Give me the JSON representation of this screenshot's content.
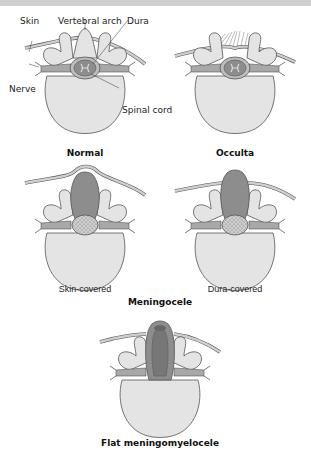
{
  "colors": {
    "bone": "#e4e4e4",
    "bone_stroke": "#555555",
    "skin": "#cccccc",
    "dura": "#8d8d8d",
    "cord": "#d9d9d9",
    "background": "#ffffff"
  },
  "labels": {
    "skin": "Skin",
    "vertebral_arch": "Vertebral arch",
    "dura": "Dura",
    "nerve": "Nerve",
    "spinal_cord": "Spinal cord"
  },
  "panels": {
    "normal": {
      "title": "Normal"
    },
    "occulta": {
      "title": "Occulta"
    },
    "meningocele": {
      "title": "Meningocele",
      "skin_covered": "Skin-covered",
      "dura_covered": "Dura-covered"
    },
    "flat_meningomyelocele": {
      "title": "Flat meningomyelocele"
    }
  }
}
